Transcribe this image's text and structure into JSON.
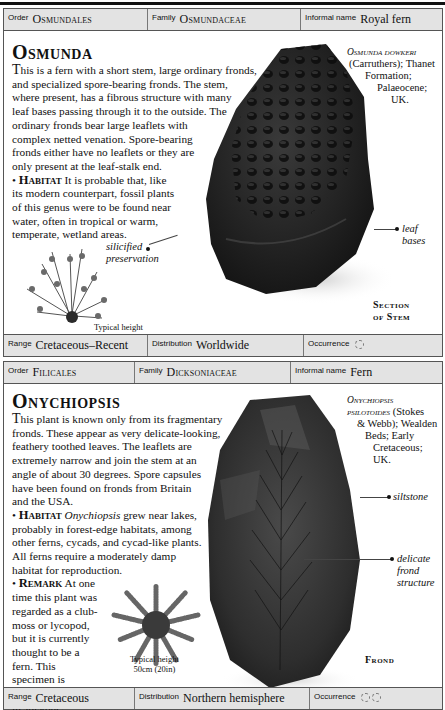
{
  "entries": [
    {
      "header": {
        "order_label": "Order",
        "order_value": "Osmundales",
        "family_label": "Family",
        "family_value": "Osmundaceae",
        "informal_label": "Informal name",
        "informal_value": "Royal fern"
      },
      "title": "Osmunda",
      "description": "This is a fern with a short stem, large ordinary fronds, and specialized spore-bearing fronds. The stem, where present, has a fibrous structure with many leaf bases passing through it to the outside. The ordinary fronds bear large leaflets with complex netted venation. Spore-bearing fronds either have no leaflets or they are only present at the leaf-stalk end.",
      "description_lead": "T",
      "description_rest": "his is a fern with a short stem, large ordinary fronds,",
      "description_lines": [
        "and specialized spore-bearing fronds. The stem,",
        "where present, has a fibrous structure with many",
        "leaf bases passing through it to the outside. The",
        "ordinary fronds bear large leaflets with",
        "complex netted venation. Spore-bearing",
        "fronds either have no leaflets or they are",
        "only present at the leaf-stalk end."
      ],
      "habitat_heading": "Habitat",
      "habitat_lines": [
        "It is probable that, like",
        "its modern counterpart, fossil plants",
        "of this genus were to be found near",
        "water, often in tropical or warm,",
        "temperate, wetland areas."
      ],
      "specimen": {
        "name": "Osmunda dowkeri",
        "lines": [
          "(Carruthers); Thanet",
          "Formation;",
          "Palaeocene;",
          "UK."
        ]
      },
      "annotations": [
        "silicified preservation",
        "leaf bases"
      ],
      "annotation_silicified_1": "silicified",
      "annotation_silicified_2": "preservation",
      "annotation_leaf_bases": "leaf bases",
      "caption": [
        "Section",
        "of Stem"
      ],
      "typical_height_label": "Typical height",
      "typical_height_value": "2m (6½ft)",
      "footer": {
        "range_label": "Range",
        "range_value": "Cretaceous–Recent",
        "distribution_label": "Distribution",
        "distribution_value": "Worldwide",
        "occurrence_label": "Occurrence",
        "occurrence_icons": 1
      }
    },
    {
      "header": {
        "order_label": "Order",
        "order_value": "Filicales",
        "family_label": "Family",
        "family_value": "Dicksoniaceae",
        "informal_label": "Informal name",
        "informal_value": "Fern"
      },
      "title": "Onychiopsis",
      "description_lead": "T",
      "description_rest": "his plant is known only from its fragmentary",
      "description_lines": [
        "fronds. These appear as very delicate-looking,",
        "feathery toothed leaves. The leaflets are",
        "extremely narrow and join the stem at an",
        "angle of about 30 degrees. Spore capsules",
        "have been found on fronds from Britain",
        "and the USA."
      ],
      "habitat_heading": "Habitat",
      "habitat_genus": "Onychiopsis",
      "habitat_first_rest": " grew near lakes,",
      "habitat_lines": [
        "probably in forest-edge habitats, among",
        "other ferns, cycads, and cycad-like plants.",
        "All ferns require a moderately damp",
        "habitat for reproduction."
      ],
      "remark_heading": "Remark",
      "remark_first": "At one",
      "remark_lines": [
        "time this plant was",
        "regarded as a club-",
        "moss or lycopod,",
        "but it is currently",
        "thought to be a",
        "fern. This",
        "specimen is",
        "preserved",
        "in siltstone."
      ],
      "specimen": {
        "name_1": "Onychiopsis",
        "name_2": "psilotoides",
        "name_2_rest": " (Stokes",
        "lines": [
          "& Webb); Wealden",
          "Beds; Early",
          "Cretaceous;",
          "UK."
        ]
      },
      "annotation_siltstone": "siltstone",
      "annotation_delicate_1": "delicate",
      "annotation_delicate_2": "frond",
      "annotation_delicate_3": "structure",
      "caption": [
        "Frond"
      ],
      "typical_height_label": "Typical height",
      "typical_height_value": "50cm (20in)",
      "footer": {
        "range_label": "Range",
        "range_value": "Cretaceous",
        "distribution_label": "Distribution",
        "distribution_value": "Northern hemisphere",
        "occurrence_label": "Occurrence",
        "occurrence_icons": 2
      }
    }
  ],
  "icons": {
    "occurrence": "dashed-circle-icon"
  },
  "colors": {
    "bar_background": "#e3e3e3",
    "border": "#555555",
    "text": "#111111",
    "fossil_dark": "#1e1e1e"
  }
}
